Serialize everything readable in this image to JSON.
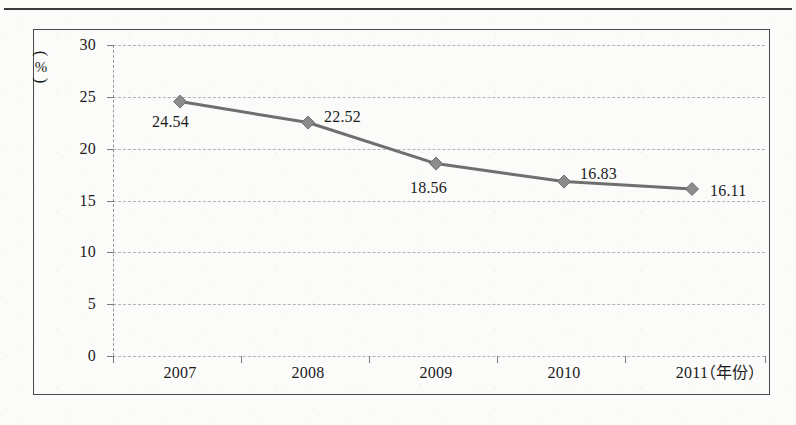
{
  "chart_data": {
    "type": "line",
    "title": "",
    "subtitle": "",
    "xlabel": "（年份）",
    "ylabel": "（%）",
    "categories": [
      "2007",
      "2008",
      "2009",
      "2010",
      "2011"
    ],
    "values": [
      24.54,
      22.52,
      18.56,
      16.83,
      16.11
    ],
    "point_labels": [
      "24.54",
      "22.52",
      "18.56",
      "16.83",
      "16.11"
    ],
    "series": [
      {
        "name": "",
        "values": [
          24.54,
          22.52,
          18.56,
          16.83,
          16.11
        ]
      }
    ],
    "ylim": [
      0,
      30
    ],
    "y_ticks": [
      0,
      5,
      10,
      15,
      20,
      25,
      30
    ],
    "y_tick_labels": [
      "0",
      "5",
      "10",
      "15",
      "20",
      "25",
      "30"
    ],
    "grid": true,
    "grid_style": "dashed-horizontal",
    "legend": false,
    "legend_position": "none",
    "marker": "diamond",
    "line_color": "#6f6f6f",
    "marker_color": "#8c8c8c",
    "grid_color": "#b4b4b4",
    "axis_color": "#7d7d7d",
    "frame_color": "#4a4a4a",
    "background_color": "#fbfbfa"
  },
  "axis": {
    "y_unit_paren": "︵",
    "y_unit_text": "%",
    "x_unit_text": "（年份）"
  }
}
